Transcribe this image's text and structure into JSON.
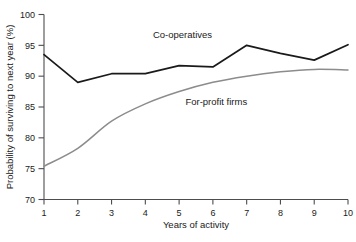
{
  "chart_data": {
    "type": "line",
    "title": "",
    "subtitle": "",
    "xlabel": "Years of activity",
    "ylabel": "Probability of surviving to next year (%)",
    "x": [
      1,
      2,
      3,
      4,
      5,
      6,
      7,
      8,
      9,
      10
    ],
    "xtick_labels": [
      "1",
      "2",
      "3",
      "4",
      "5",
      "6",
      "7",
      "8",
      "9",
      "10"
    ],
    "ytick_labels": [
      "70",
      "75",
      "80",
      "85",
      "90",
      "95",
      "100"
    ],
    "yticks": [
      70,
      75,
      80,
      85,
      90,
      95,
      100
    ],
    "xlim": [
      1,
      10
    ],
    "ylim": [
      70,
      100
    ],
    "grid": false,
    "legend_position": "inline-annotation",
    "series": [
      {
        "name": "Co-operatives",
        "color": "#1a1a1a",
        "label_x": 5.1,
        "label_y": 96.2,
        "values": [
          93.5,
          89.0,
          90.4,
          90.4,
          91.7,
          91.5,
          95.0,
          93.7,
          92.6,
          95.1
        ]
      },
      {
        "name": "For-profit firms",
        "color": "#8c8c8c",
        "smooth": true,
        "label_x": 6.1,
        "label_y": 85.3,
        "values": [
          75.4,
          78.3,
          82.7,
          85.5,
          87.5,
          89.0,
          90.0,
          90.7,
          91.1,
          91.0
        ]
      }
    ]
  }
}
